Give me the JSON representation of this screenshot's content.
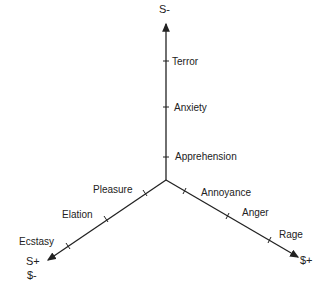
{
  "diagram": {
    "type": "three-axis emotion space",
    "axes": {
      "vertical": {
        "end_label": "S-",
        "ticks": [
          "Apprehension",
          "Anxiety",
          "Terror"
        ]
      },
      "lower_left": {
        "end_label_1": "S+",
        "end_label_2": "$-",
        "ticks": [
          "Pleasure",
          "Elation",
          "Ecstasy"
        ]
      },
      "lower_right": {
        "end_label": "$+",
        "ticks": [
          "Annoyance",
          "Anger",
          "Rage"
        ]
      }
    },
    "line_color": "#222222"
  }
}
